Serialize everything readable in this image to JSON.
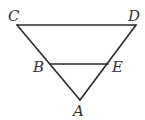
{
  "diagram": {
    "type": "geometry-figure",
    "points": {
      "C": {
        "label": "C",
        "x": 17,
        "y": 25,
        "label_x": 8,
        "label_y": 21
      },
      "D": {
        "label": "D",
        "x": 136,
        "y": 25,
        "label_x": 128,
        "label_y": 21
      },
      "B": {
        "label": "B",
        "x": 50,
        "y": 64,
        "label_x": 33,
        "label_y": 72
      },
      "E": {
        "label": "E",
        "x": 108,
        "y": 64,
        "label_x": 112,
        "label_y": 72
      },
      "A": {
        "label": "A",
        "x": 80,
        "y": 100,
        "label_x": 73,
        "label_y": 116
      }
    },
    "segments": [
      {
        "from": "C",
        "to": "D"
      },
      {
        "from": "C",
        "to": "A"
      },
      {
        "from": "D",
        "to": "A"
      },
      {
        "from": "B",
        "to": "E"
      }
    ],
    "stroke_color": "#2b2b2b",
    "label_color": "#333333"
  }
}
